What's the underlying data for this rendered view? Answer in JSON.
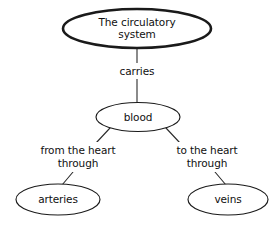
{
  "diagram": {
    "type": "concept-map",
    "background_color": "#ffffff",
    "stroke_color": "#1a1a1a",
    "text_color": "#101010",
    "nodes": [
      {
        "id": "circulatory-system",
        "label_line1": "The circulatory",
        "label_line2": "system",
        "full_label": "The circulatory system",
        "emphasis": "thick"
      },
      {
        "id": "blood",
        "label": "blood",
        "emphasis": "thin"
      },
      {
        "id": "arteries",
        "label": "arteries",
        "emphasis": "thin"
      },
      {
        "id": "veins",
        "label": "veins",
        "emphasis": "thin"
      }
    ],
    "edges": [
      {
        "id": "carries",
        "from": "circulatory-system",
        "to": "blood",
        "label": "carries"
      },
      {
        "id": "from-the-heart-through",
        "from": "blood",
        "to": "arteries",
        "label_line1": "from the heart",
        "label_line2": "through",
        "full_label": "from the heart through"
      },
      {
        "id": "to-the-heart-through",
        "from": "blood",
        "to": "veins",
        "label_line1": "to the heart",
        "label_line2": "through",
        "full_label": "to the heart through"
      }
    ]
  }
}
